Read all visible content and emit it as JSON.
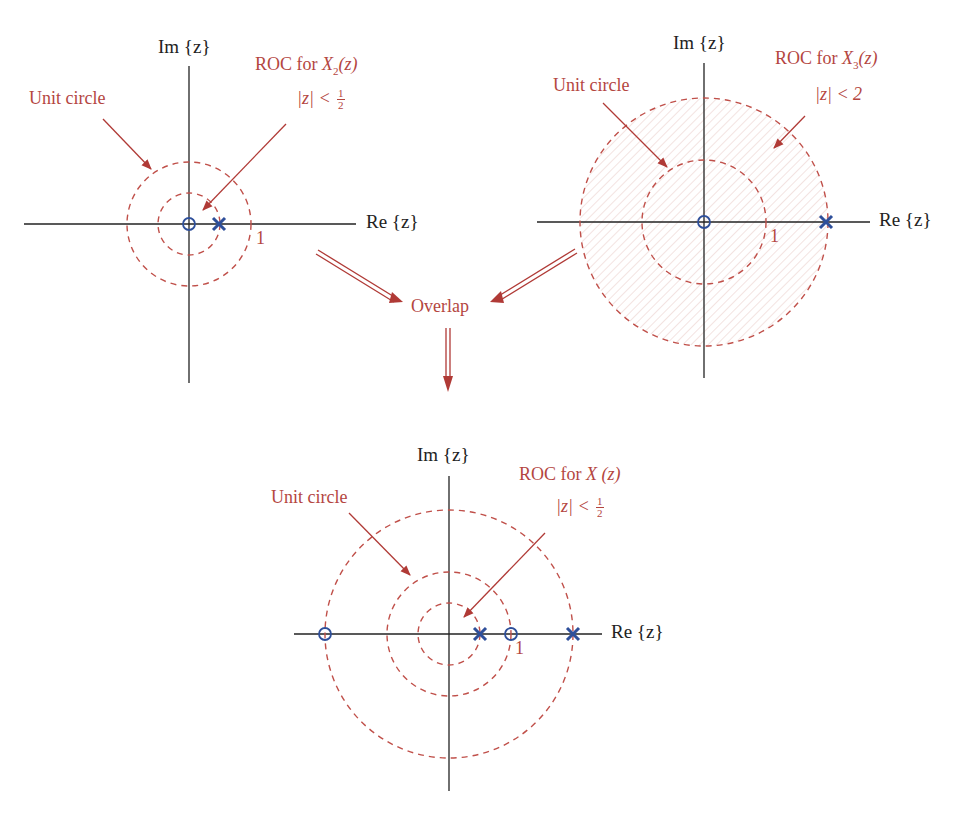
{
  "colors": {
    "axis": "#222222",
    "annotation": "#b4463f",
    "circle": "#c0504a",
    "pole_zero": "#2e4f9a",
    "arrow": "#b03a36"
  },
  "plots": {
    "x2": {
      "center": [
        189,
        224
      ],
      "unit_radius_px": 62,
      "im_label": "Im {z}",
      "re_label": "Re {z}",
      "tick_one": "1",
      "unit_circle_label": "Unit circle",
      "roc_title_prefix": "ROC for ",
      "roc_title_func": "X",
      "roc_title_sub": "2",
      "roc_title_arg": "(z)",
      "roc_cond_lhs": "|z| < ",
      "roc_cond_num": "1",
      "roc_cond_den": "2",
      "circles": [
        0.5,
        1
      ],
      "zeros": [
        0
      ],
      "poles": [
        0.5
      ]
    },
    "x3": {
      "center": [
        704,
        222
      ],
      "unit_radius_px": 62,
      "im_label": "Im {z}",
      "re_label": "Re {z}",
      "tick_one": "1",
      "unit_circle_label": "Unit circle",
      "roc_title_prefix": "ROC for ",
      "roc_title_func": "X",
      "roc_title_sub": "3",
      "roc_title_arg": "(z)",
      "roc_cond": "|z| < 2",
      "circles": [
        1,
        2
      ],
      "zeros": [
        0
      ],
      "poles": [
        2
      ]
    },
    "x": {
      "center": [
        449,
        634
      ],
      "unit_radius_px": 62,
      "im_label": "Im {z}",
      "re_label": "Re {z}",
      "tick_one": "1",
      "unit_circle_label": "Unit circle",
      "roc_title_prefix": "ROC for ",
      "roc_title_func": "X",
      "roc_title_arg": " (z)",
      "roc_cond_lhs": "|z| < ",
      "roc_cond_num": "1",
      "roc_cond_den": "2",
      "circles": [
        0.5,
        1,
        2
      ],
      "zeros": [
        -2,
        1
      ],
      "poles": [
        0.5,
        2
      ]
    }
  },
  "flow": {
    "overlap_label": "Overlap"
  }
}
